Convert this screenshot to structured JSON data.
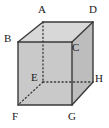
{
  "figure": {
    "name": "cube-diagram",
    "type": "geometry-solid",
    "solid": "cube",
    "background_color": "#ffffff"
  },
  "colors": {
    "edge_visible": "#3a3a3a",
    "edge_hidden": "#3a3a3a",
    "face_front": "#c9c9c9",
    "face_top": "#d8d8d8",
    "face_right": "#bdbdbd",
    "label_text": "#1a1a1a"
  },
  "vertices": [
    {
      "id": "A",
      "label": "A",
      "x": 43,
      "y": 22,
      "label_x": 38,
      "label_y": 6,
      "hidden": false
    },
    {
      "id": "B",
      "label": "B",
      "x": 18,
      "y": 42,
      "label_x": 5,
      "label_y": 34,
      "hidden": false
    },
    {
      "id": "C",
      "label": "C",
      "x": 72,
      "y": 42,
      "label_x": 72,
      "label_y": 42,
      "hidden": false
    },
    {
      "id": "D",
      "label": "D",
      "x": 93,
      "y": 22,
      "label_x": 90,
      "label_y": 6,
      "hidden": false
    },
    {
      "id": "E",
      "label": "E",
      "x": 43,
      "y": 82,
      "label_x": 32,
      "label_y": 72,
      "hidden": true
    },
    {
      "id": "F",
      "label": "F",
      "x": 18,
      "y": 105,
      "label_x": 13,
      "label_y": 112,
      "hidden": false
    },
    {
      "id": "G",
      "label": "G",
      "x": 72,
      "y": 105,
      "label_x": 69,
      "label_y": 112,
      "hidden": false
    },
    {
      "id": "H",
      "label": "H",
      "x": 93,
      "y": 82,
      "label_x": 95,
      "label_y": 74,
      "hidden": false
    }
  ],
  "edges": [
    {
      "from": "B",
      "to": "C",
      "style": "solid",
      "name": "edge-BC"
    },
    {
      "from": "C",
      "to": "G",
      "style": "solid",
      "name": "edge-CG"
    },
    {
      "from": "G",
      "to": "F",
      "style": "solid",
      "name": "edge-GF"
    },
    {
      "from": "F",
      "to": "B",
      "style": "solid",
      "name": "edge-FB"
    },
    {
      "from": "A",
      "to": "D",
      "style": "solid",
      "name": "edge-AD"
    },
    {
      "from": "D",
      "to": "H",
      "style": "solid",
      "name": "edge-DH"
    },
    {
      "from": "A",
      "to": "B",
      "style": "solid",
      "name": "edge-AB"
    },
    {
      "from": "D",
      "to": "C",
      "style": "solid",
      "name": "edge-DC"
    },
    {
      "from": "H",
      "to": "G",
      "style": "solid",
      "name": "edge-HG"
    },
    {
      "from": "A",
      "to": "E",
      "style": "dotted",
      "name": "edge-AE"
    },
    {
      "from": "E",
      "to": "H",
      "style": "dotted",
      "name": "edge-EH"
    },
    {
      "from": "E",
      "to": "F",
      "style": "dotted",
      "name": "edge-EF"
    }
  ],
  "faces": [
    {
      "id": "top",
      "name": "face-top",
      "points": "18,42 43,22 93,22 72,42"
    },
    {
      "id": "right",
      "name": "face-right",
      "points": "72,42 93,22 93,82 72,105"
    },
    {
      "id": "front",
      "name": "face-front",
      "points": "18,42 72,42 72,105 18,105"
    }
  ]
}
